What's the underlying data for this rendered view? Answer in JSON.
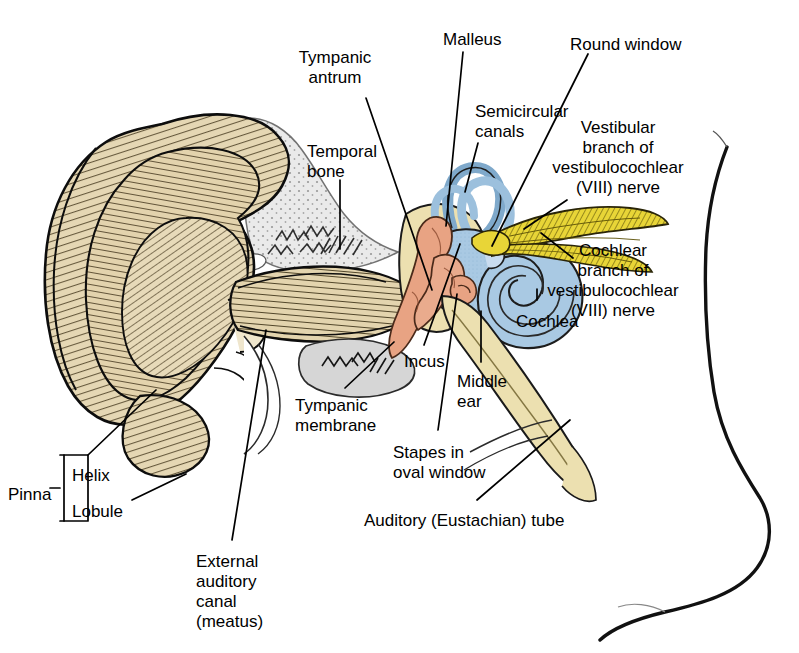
{
  "figure": {
    "type": "anatomical-illustration",
    "width": 799,
    "height": 653,
    "background": "#ffffff"
  },
  "palette": {
    "pinna_fill": "#e5d7b4",
    "pinna_shadow": "#d8c79c",
    "canal_fill": "#e3d4ae",
    "inner_ear_blue": "#a9c9e3",
    "inner_ear_blue_dark": "#8ab3d4",
    "ossicle_salmon": "#e8a383",
    "nerve_yellow": "#e8d537",
    "eustachian_cream": "#ece0b0",
    "temporal_bone_gray": "#d9d9d9",
    "outline": "#000000",
    "text": "#000000"
  },
  "labels": [
    {
      "id": "tympanic-antrum",
      "text": "Tympanic\nantrum",
      "x": 332,
      "y": 58,
      "align": "center"
    },
    {
      "id": "malleus",
      "text": "Malleus",
      "x": 443,
      "y": 30,
      "align": "left"
    },
    {
      "id": "round-window",
      "text": "Round window",
      "x": 570,
      "y": 35,
      "align": "left"
    },
    {
      "id": "temporal-bone",
      "text": "Temporal\nbone",
      "x": 307,
      "y": 142,
      "align": "left"
    },
    {
      "id": "semicircular-canals",
      "text": "Semicircular\ncanals",
      "x": 475,
      "y": 102,
      "align": "left"
    },
    {
      "id": "vestibular-branch",
      "text": "Vestibular\nbranch of\nvestibulocochlear\n(VIII) nerve",
      "x": 608,
      "y": 118,
      "align": "center"
    },
    {
      "id": "cochlear-branch",
      "text": "Cochlear\nbranch of\nvestibulocochlear\n(VIII) nerve",
      "x": 603,
      "y": 241,
      "align": "center"
    },
    {
      "id": "cochlea",
      "text": "Cochlea",
      "x": 516,
      "y": 312,
      "align": "left"
    },
    {
      "id": "incus",
      "text": "Incus",
      "x": 404,
      "y": 352,
      "align": "left"
    },
    {
      "id": "middle-ear",
      "text": "Middle\near",
      "x": 457,
      "y": 372,
      "align": "left"
    },
    {
      "id": "tympanic-membrane",
      "text": "Tympanic\nmembrane",
      "x": 295,
      "y": 396,
      "align": "left"
    },
    {
      "id": "stapes-oval-window",
      "text": "Stapes in\noval window",
      "x": 393,
      "y": 443,
      "align": "left"
    },
    {
      "id": "auditory-eustachian-tube",
      "text": "Auditory (Eustachian) tube",
      "x": 364,
      "y": 511,
      "align": "left"
    },
    {
      "id": "pinna",
      "text": "Pinna",
      "x": 8,
      "y": 485,
      "align": "left"
    },
    {
      "id": "helix",
      "text": "Helix",
      "x": 68,
      "y": 468,
      "align": "left"
    },
    {
      "id": "lobule",
      "text": "Lobule",
      "x": 68,
      "y": 506,
      "align": "left"
    },
    {
      "id": "external-auditory-canal",
      "text": "External\nauditory\ncanal\n(meatus)",
      "x": 196,
      "y": 552,
      "align": "left"
    }
  ],
  "structures": [
    {
      "id": "pinna",
      "name": "Pinna (auricle)",
      "color": "#e5d7b4"
    },
    {
      "id": "helix",
      "name": "Helix",
      "color": "#e5d7b4"
    },
    {
      "id": "lobule",
      "name": "Lobule",
      "color": "#e5d7b4"
    },
    {
      "id": "external-auditory-canal",
      "name": "External auditory canal (meatus)",
      "color": "#e3d4ae"
    },
    {
      "id": "temporal-bone",
      "name": "Temporal bone",
      "color": "#d9d9d9"
    },
    {
      "id": "tympanic-membrane",
      "name": "Tympanic membrane",
      "color": "#d9d9d9"
    },
    {
      "id": "tympanic-antrum",
      "name": "Tympanic antrum",
      "color": "#ece0b0"
    },
    {
      "id": "malleus",
      "name": "Malleus",
      "color": "#e8a383"
    },
    {
      "id": "incus",
      "name": "Incus",
      "color": "#e8a383"
    },
    {
      "id": "stapes",
      "name": "Stapes in oval window",
      "color": "#e8a383"
    },
    {
      "id": "middle-ear",
      "name": "Middle ear cavity",
      "color": "#ece0b0"
    },
    {
      "id": "semicircular-canals",
      "name": "Semicircular canals",
      "color": "#a9c9e3"
    },
    {
      "id": "cochlea",
      "name": "Cochlea",
      "color": "#a9c9e3"
    },
    {
      "id": "round-window",
      "name": "Round window",
      "color": "#a9c9e3"
    },
    {
      "id": "vestibular-branch",
      "name": "Vestibular branch of vestibulocochlear (VIII) nerve",
      "color": "#e8d537"
    },
    {
      "id": "cochlear-branch",
      "name": "Cochlear branch of vestibulocochlear (VIII) nerve",
      "color": "#e8d537"
    },
    {
      "id": "auditory-eustachian-tube",
      "name": "Auditory (Eustachian) tube",
      "color": "#ece0b0"
    },
    {
      "id": "head-profile",
      "name": "Head and neck profile outline",
      "color": "#ffffff"
    }
  ],
  "leader_lines": [
    {
      "id": "tympanic-antrum",
      "from": [
        366,
        98
      ],
      "to": [
        432,
        290
      ]
    },
    {
      "id": "malleus",
      "from": [
        463,
        52
      ],
      "to": [
        445,
        225
      ]
    },
    {
      "id": "round-window",
      "from": [
        588,
        54
      ],
      "to": [
        492,
        245
      ]
    },
    {
      "id": "temporal-bone",
      "from": [
        340,
        180
      ],
      "to": [
        340,
        247
      ]
    },
    {
      "id": "semicircular-canals",
      "from": [
        478,
        143
      ],
      "to": [
        464,
        190
      ]
    },
    {
      "id": "vestibular-branch",
      "from": [
        567,
        200
      ],
      "to": [
        523,
        228
      ]
    },
    {
      "id": "cochlear-branch",
      "from": [
        573,
        258
      ],
      "to": [
        540,
        232
      ]
    },
    {
      "id": "cochlea",
      "from": [
        537,
        300
      ],
      "to": [
        537,
        288
      ]
    },
    {
      "id": "incus",
      "from": [
        424,
        345
      ],
      "to": [
        461,
        243
      ]
    },
    {
      "id": "middle-ear",
      "from": [
        481,
        362
      ],
      "to": [
        481,
        312
      ]
    },
    {
      "id": "tympanic-membrane",
      "from": [
        345,
        388
      ],
      "to": [
        394,
        340
      ]
    },
    {
      "id": "stapes-oval-window",
      "from": [
        438,
        430
      ],
      "to": [
        456,
        293
      ]
    },
    {
      "id": "auditory-eustachian-tube",
      "from": [
        477,
        500
      ],
      "to": [
        570,
        420
      ]
    },
    {
      "id": "helix",
      "from": [
        88,
        455
      ],
      "to": [
        155,
        389
      ]
    },
    {
      "id": "lobule",
      "from": [
        132,
        506
      ],
      "to": [
        185,
        475
      ]
    },
    {
      "id": "external-auditory-canal",
      "from": [
        232,
        540
      ],
      "to": [
        265,
        330
      ]
    }
  ]
}
